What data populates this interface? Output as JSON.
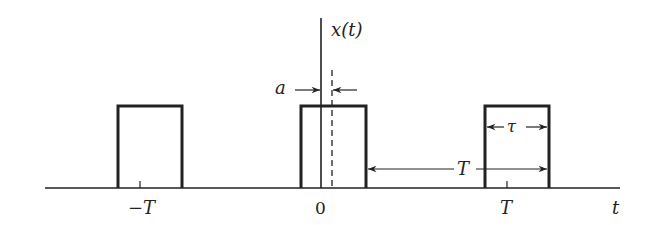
{
  "diagram": {
    "signal_label": "x(t)",
    "time_axis_label": "t",
    "tick_labels": [
      "−T",
      "0",
      "T"
    ],
    "annotations": {
      "offset_label": "a",
      "pulse_width_label": "τ",
      "period_label": "T"
    },
    "colors": {
      "stroke": "#222222",
      "background": "#ffffff"
    }
  }
}
